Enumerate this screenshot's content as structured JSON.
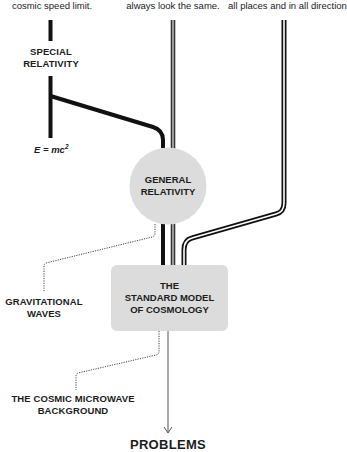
{
  "captions": {
    "left": "cosmic speed limit.",
    "middle": "always look the same.",
    "right": "all places and in all directions."
  },
  "labels": {
    "special_relativity_line1": "SPECIAL",
    "special_relativity_line2": "RELATIVITY",
    "formula_base": "E = mc",
    "formula_exp": "2",
    "gravitational_waves_line1": "GRAVITATIONAL",
    "gravitational_waves_line2": "WAVES",
    "cmb_line1": "THE COSMIC MICROWAVE",
    "cmb_line2": "BACKGROUND",
    "problems": "PROBLEMS"
  },
  "nodes": {
    "general_relativity": {
      "line1": "GENERAL",
      "line2": "RELATIVITY",
      "shape": "circle",
      "fill": "#dcdcdc"
    },
    "standard_model": {
      "line1": "THE",
      "line2": "STANDARD MODEL",
      "line3": "OF COSMOLOGY",
      "shape": "rounded-rectangle",
      "fill": "#dcdcdc"
    }
  },
  "colors": {
    "black_line": "#111111",
    "gray_line": "#8a8a8a",
    "node_fill": "#dcdcdc",
    "dotted_line": "#444444",
    "arrow": "#555555"
  }
}
